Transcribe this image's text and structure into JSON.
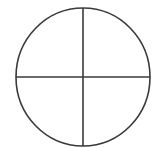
{
  "diagram": {
    "type": "circle-divided-into-quadrants",
    "quadrant_count": 4,
    "stroke_color": "#3a3a3a",
    "background_color": "#ffffff",
    "circle": {
      "cx": 83,
      "cy": 77,
      "rx": 67,
      "ry": 69
    },
    "stroke_width": 1.6
  }
}
